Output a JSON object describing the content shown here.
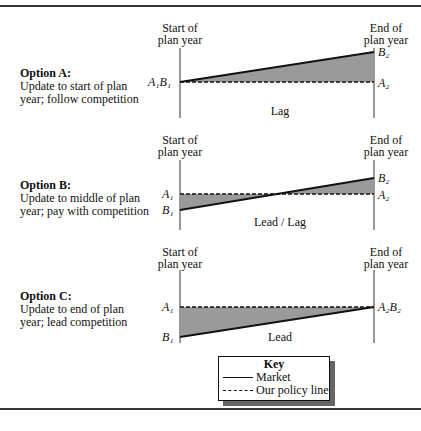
{
  "options": [
    {
      "title": "Option A:",
      "desc1": "Update to start of plan",
      "desc2": "year; follow competition",
      "start_label1": "Start of",
      "start_label2": "plan year",
      "end_label1": "End of",
      "end_label2": "plan year",
      "left_point": "A₁B₁",
      "right_top": "B₂",
      "right_bottom": "A₂",
      "region_label": "Lag"
    },
    {
      "title": "Option B:",
      "desc1": "Update to middle of plan",
      "desc2": "year; pay with competition",
      "start_label1": "Start of",
      "start_label2": "plan year",
      "end_label1": "End of",
      "end_label2": "plan year",
      "left_top": "A₁",
      "left_bottom": "B₁",
      "right_top": "B₂",
      "right_bottom": "A₂",
      "region_label": "Lead / Lag"
    },
    {
      "title": "Option C:",
      "desc1": "Update to end of plan",
      "desc2": "year; lead competition",
      "start_label1": "Start of",
      "start_label2": "plan year",
      "end_label1": "End of",
      "end_label2": "plan year",
      "left_top": "A₁",
      "left_bottom": "B₁",
      "right_point": "A₂B₂",
      "region_label": "Lead"
    }
  ],
  "key": {
    "title": "Key",
    "market": "Market",
    "policy": "Our policy line"
  },
  "colors": {
    "fill": "#9a9a9a",
    "line": "#111111"
  }
}
